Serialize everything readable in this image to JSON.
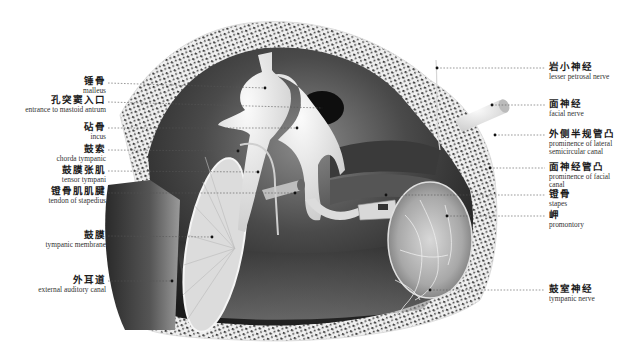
{
  "diagram": {
    "colors": {
      "background": "#ffffff",
      "bone_fill": "#eeeeee",
      "bone_pores": "#3a3a3a",
      "cavity_dark": "#1e1e1e",
      "cavity_mid": "#6a6a6a",
      "ossicle": "#e6e6e6",
      "leader_line": "#555555"
    },
    "labels_left": [
      {
        "id": "malleus",
        "zh": "锤骨",
        "en": "malleus"
      },
      {
        "id": "mastoid-antrum-entrance",
        "zh": "孔突窦入口",
        "en": "entrance to mastoid antrum"
      },
      {
        "id": "incus",
        "zh": "砧骨",
        "en": "incus"
      },
      {
        "id": "chorda-tympani",
        "zh": "鼓索",
        "en": "chorda tympanic"
      },
      {
        "id": "tensor-tympani",
        "zh": "鼓膜张肌",
        "en": "tensor tympani"
      },
      {
        "id": "stapedius-tendon",
        "zh": "镫骨肌肌腱",
        "en": "tendon of stapedius"
      },
      {
        "id": "tympanic-membrane",
        "zh": "鼓膜",
        "en": "tympanic membrane"
      },
      {
        "id": "external-auditory-canal",
        "zh": "外耳道",
        "en": "external auditory canal"
      }
    ],
    "labels_right": [
      {
        "id": "lesser-petrosal-nerve",
        "zh": "岩小神经",
        "en": "lesser petrosal nerve"
      },
      {
        "id": "facial-nerve",
        "zh": "面神经",
        "en": "facial nerve"
      },
      {
        "id": "lateral-semicircular-prominence",
        "zh": "外侧半规管凸",
        "en": "prominence of lateral semicircular canal"
      },
      {
        "id": "facial-canal-prominence",
        "zh": "面神经管凸",
        "en": "prominence of facial canal"
      },
      {
        "id": "stapes",
        "zh": "镫骨",
        "en": "stapes"
      },
      {
        "id": "promontory",
        "zh": "岬",
        "en": "promontory"
      },
      {
        "id": "tympanic-nerve",
        "zh": "鼓室神经",
        "en": "tympanic nerve"
      }
    ]
  }
}
